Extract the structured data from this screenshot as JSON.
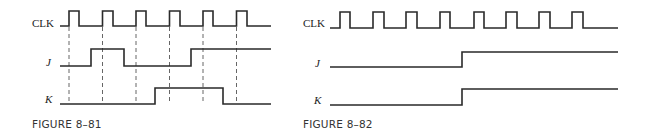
{
  "figures": [
    {
      "id": "fig-8-81",
      "caption": "FIGURE 8–81",
      "signals": [
        {
          "name": "CLK",
          "italic": false,
          "type": "clock"
        },
        {
          "name": "J",
          "italic": true,
          "type": "data"
        },
        {
          "name": "K",
          "italic": true,
          "type": "data"
        }
      ],
      "clock_pulses": 6,
      "dashed_guides_at_clock_edges": true,
      "waveforms": {
        "CLK": [
          0,
          1,
          0,
          0,
          1,
          0,
          0,
          1,
          0,
          0,
          1,
          0,
          0,
          1,
          0,
          0,
          1,
          0,
          0
        ],
        "J_description": "low, high across clock 2, low across clocks 3-4, high from before clock 5 onward",
        "K_description": "low through clock 3, high across clocks 4-5, low at clock 6"
      },
      "levels_at_clock_edges": {
        "J": [
          0,
          1,
          0,
          0,
          1,
          1
        ],
        "K": [
          0,
          0,
          0,
          1,
          1,
          0
        ]
      }
    },
    {
      "id": "fig-8-82",
      "caption": "FIGURE 8–82",
      "signals": [
        {
          "name": "CLK",
          "italic": false,
          "type": "clock"
        },
        {
          "name": "J",
          "italic": true,
          "type": "data"
        },
        {
          "name": "K",
          "italic": true,
          "type": "data"
        }
      ],
      "clock_pulses": 8,
      "dashed_guides_at_clock_edges": false,
      "levels_at_clock_edges": {
        "J": [
          0,
          0,
          0,
          0,
          1,
          1,
          1,
          1
        ],
        "K": [
          0,
          0,
          0,
          0,
          1,
          1,
          1,
          1
        ]
      },
      "J_K_transition": "both go high simultaneously between clock pulses 4 and 5"
    }
  ]
}
